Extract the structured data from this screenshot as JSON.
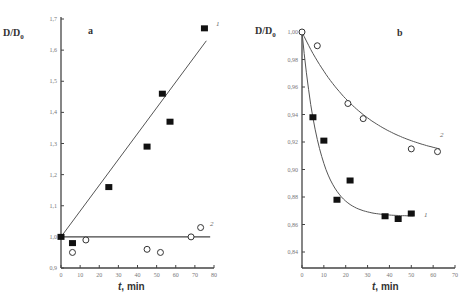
{
  "chart_data": [
    {
      "type": "scatter",
      "panel": "a",
      "title": "a",
      "xlabel": "t, min",
      "ylabel": "D/D0",
      "xlim": [
        0,
        80
      ],
      "ylim": [
        0.9,
        1.7
      ],
      "xticks": [
        "0",
        "10",
        "20",
        "30",
        "40",
        "50",
        "60",
        "70",
        "80"
      ],
      "yticks": [
        "0.9",
        "1.0",
        "1.1",
        "1.2",
        "1.3",
        "1.4",
        "1.5",
        "1.6",
        "1.7"
      ],
      "grid": false,
      "series": [
        {
          "name": "1",
          "marker": "filled-square",
          "fit": "linear",
          "fit_line": [
            [
              0,
              1.0
            ],
            [
              76,
              1.63
            ]
          ],
          "x": [
            0,
            6,
            25,
            45,
            53,
            57,
            75
          ],
          "y": [
            1.0,
            0.98,
            1.16,
            1.29,
            1.46,
            1.37,
            1.67
          ]
        },
        {
          "name": "2",
          "marker": "open-circle",
          "fit": "constant",
          "fit_line": [
            [
              0,
              1.0
            ],
            [
              78,
              1.0
            ]
          ],
          "x": [
            6,
            13,
            45,
            52,
            68,
            73
          ],
          "y": [
            0.95,
            0.99,
            0.96,
            0.95,
            1.0,
            1.03
          ]
        }
      ]
    },
    {
      "type": "scatter",
      "panel": "b",
      "title": "b",
      "xlabel": "t, min",
      "ylabel": "D/D0",
      "xlim": [
        0,
        70
      ],
      "ylim": [
        0.83,
        1.0
      ],
      "xticks": [
        "0",
        "10",
        "20",
        "30",
        "40",
        "50",
        "60",
        "70"
      ],
      "yticks": [
        "0.84",
        "0.86",
        "0.88",
        "0.90",
        "0.92",
        "0.94",
        "0.96",
        "0.98",
        "1.00"
      ],
      "grid": false,
      "series": [
        {
          "name": "1",
          "marker": "filled-square",
          "fit": "exponential-decay",
          "x": [
            5,
            10,
            16,
            22,
            38,
            44,
            50
          ],
          "y": [
            0.938,
            0.921,
            0.878,
            0.892,
            0.866,
            0.864,
            0.868
          ]
        },
        {
          "name": "2",
          "marker": "open-circle",
          "fit": "smooth-decay",
          "x": [
            0,
            7,
            21,
            28,
            50,
            62
          ],
          "y": [
            1.0,
            0.99,
            0.948,
            0.937,
            0.915,
            0.913
          ]
        }
      ]
    }
  ],
  "labels": {
    "ylabel_main": "D/D",
    "ylabel_sub": "0",
    "xlabel_italic": "t",
    "xlabel_rest": ", min",
    "panel_a": "a",
    "panel_b": "b",
    "series_1": "1",
    "series_2": "2"
  }
}
